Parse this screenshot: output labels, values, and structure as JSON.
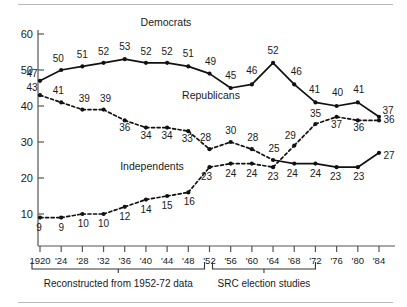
{
  "chart_data": {
    "type": "line",
    "title": "",
    "xlabel": "",
    "ylabel": "",
    "ylim": [
      0,
      60
    ],
    "yticks": [
      10,
      20,
      30,
      40,
      50,
      60
    ],
    "grid": false,
    "legend_position": "inline-annotation",
    "x": [
      1920,
      1924,
      1928,
      1932,
      1936,
      1940,
      1944,
      1948,
      1952,
      1956,
      1960,
      1964,
      1968,
      1972,
      1976,
      1980,
      1984
    ],
    "categories": [
      "1920",
      "'24",
      "'28",
      "'32",
      "'36",
      "'40",
      "'44",
      "'48",
      "'52",
      "'56",
      "'60",
      "'64",
      "'68",
      "'72",
      "'76",
      "'80",
      "'84"
    ],
    "series": [
      {
        "name": "Democrats",
        "style": "solid",
        "values": [
          47,
          50,
          51,
          52,
          53,
          52,
          52,
          51,
          49,
          45,
          46,
          52,
          46,
          41,
          40,
          41,
          37
        ]
      },
      {
        "name": "Republicans",
        "style": "dashed-then-solid",
        "values": [
          43,
          41,
          39,
          39,
          36,
          34,
          34,
          33,
          28,
          30,
          28,
          25,
          24,
          24,
          23,
          23,
          27
        ]
      },
      {
        "name": "Independents",
        "style": "dashed",
        "values": [
          9,
          9,
          10,
          10,
          12,
          14,
          15,
          16,
          23,
          24,
          24,
          23,
          29,
          35,
          37,
          36,
          36
        ]
      }
    ],
    "annotations": [
      {
        "text": "Reconstructed from 1952-72 data",
        "span": [
          "1920",
          "'52"
        ]
      },
      {
        "text": "SRC election studies",
        "span": [
          "'52",
          "'72"
        ]
      }
    ]
  },
  "axis": {
    "y_tick_labels": [
      "60",
      "50",
      "40",
      "30",
      "20",
      "10"
    ],
    "x_tick_labels": [
      "1920",
      "'24",
      "'28",
      "'32",
      "'36",
      "'40",
      "'44",
      "'48",
      "'52",
      "'56",
      "'60",
      "'64",
      "'68",
      "'72",
      "'76",
      "'80",
      "'84"
    ]
  },
  "series_labels": {
    "democrats": "Democrats",
    "republicans": "Republicans",
    "independents": "Independents"
  },
  "data_labels": {
    "democrats": [
      "47",
      "50",
      "51",
      "52",
      "53",
      "52",
      "52",
      "51",
      "49",
      "45",
      "46",
      "52",
      "46",
      "41",
      "40",
      "41",
      "37"
    ],
    "republicans": [
      "43",
      "41",
      "39",
      "39",
      "36",
      "34",
      "34",
      "33",
      "28",
      "30",
      "28",
      "25",
      "24",
      "24",
      "23",
      "23",
      "27"
    ],
    "independents": [
      "9",
      "9",
      "10",
      "10",
      "12",
      "14",
      "15",
      "16",
      "23",
      "24",
      "24",
      "23",
      "29",
      "35",
      "37",
      "36",
      "36"
    ]
  },
  "brackets": {
    "left_label": "Reconstructed from 1952-72 data",
    "right_label": "SRC election studies"
  },
  "colors": {
    "line": "#111111",
    "text": "#1a1a1a",
    "axis": "#555555",
    "rule": "#b9b9b9",
    "background": "#ffffff"
  }
}
